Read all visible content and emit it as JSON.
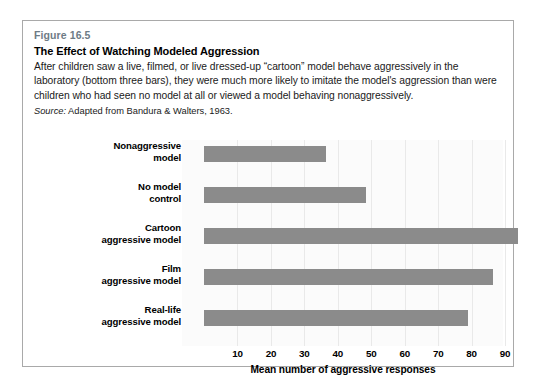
{
  "figure": {
    "number": "Figure 16.5",
    "title": "The Effect of Watching Modeled Aggression",
    "description": "After children saw a live, filmed, or live dressed-up “cartoon” model behave aggressively in the laboratory (bottom three bars), they were much more likely to imitate the model's aggression than were children who had seen no model at all or viewed a model behaving nonaggressively.",
    "source_label": "Source:",
    "source_text": " Adapted from Bandura & Walters, 1963."
  },
  "colors": {
    "bar": "#8b8b8b",
    "figure_number": "#6e7b85",
    "border": "#a9a9a9",
    "plot_background": "#fbfbfb",
    "gridline": "#e9e9e9"
  },
  "chart_data": {
    "type": "bar",
    "orientation": "horizontal",
    "title": "The Effect of Watching Modeled Aggression",
    "xlabel": "Mean number of aggressive responses",
    "ylabel": "",
    "xlim": [
      0,
      96
    ],
    "xticks": [
      10,
      20,
      30,
      40,
      50,
      60,
      70,
      80,
      90
    ],
    "xticklabels": [
      "10",
      "20",
      "30",
      "40",
      "50",
      "60",
      "70",
      "80",
      "90"
    ],
    "grid": true,
    "grid_axis": "x",
    "legend": false,
    "categories": [
      {
        "line1": "Nonaggressive",
        "line2": "model"
      },
      {
        "line1": "No model",
        "line2": "control"
      },
      {
        "line1": "Cartoon",
        "line2": "aggressive model"
      },
      {
        "line1": "Film",
        "line2": "aggressive model"
      },
      {
        "line1": "Real-life",
        "line2": "aggressive model"
      }
    ],
    "values": [
      36.5,
      48.5,
      94,
      86.5,
      79
    ]
  }
}
